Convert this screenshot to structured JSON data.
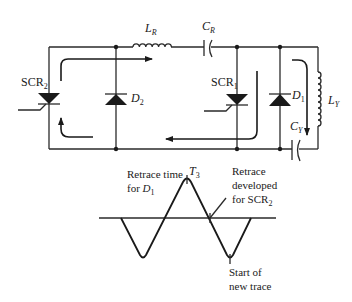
{
  "diagram": {
    "type": "circuit-schematic-with-waveform",
    "circuit": {
      "components": {
        "scr2": {
          "label": "SCR",
          "sub": "2"
        },
        "d2": {
          "label": "D",
          "sub": "2"
        },
        "lr": {
          "label": "L",
          "sub": "R"
        },
        "cr": {
          "label": "C",
          "sub": "R"
        },
        "scr1": {
          "label": "SCR",
          "sub": "1"
        },
        "d1": {
          "label": "D",
          "sub": "1"
        },
        "ly": {
          "label": "L",
          "sub": "Y"
        },
        "cy": {
          "label": "C",
          "sub": "Y"
        }
      }
    },
    "waveform": {
      "peak_label": {
        "label": "T",
        "sub": "3"
      },
      "annotations": {
        "retrace_d1": {
          "line1": "Retrace time",
          "line2_prefix": "for ",
          "line2_sym": "D",
          "line2_sub": "1"
        },
        "retrace_scr2": {
          "line1": "Retrace",
          "line2": "developed",
          "line3_prefix": "for SCR",
          "line3_sub": "2"
        },
        "start_trace": {
          "line1": "Start of",
          "line2": "new trace"
        }
      }
    }
  }
}
